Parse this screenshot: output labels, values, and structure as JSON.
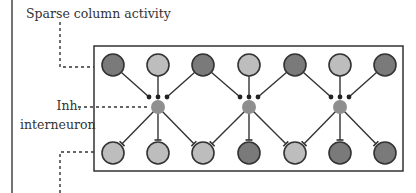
{
  "labels": {
    "sparse": "Sparse column activity",
    "inh_line1": "Inh.",
    "inh_line2": "interneuron"
  },
  "colors": {
    "dark": "#7a7a7a",
    "light": "#bdbdbd",
    "interneuron": "#8f8f8f",
    "stroke": "#333333"
  },
  "top_row": [
    "dark",
    "light",
    "dark",
    "light",
    "dark",
    "light",
    "dark"
  ],
  "bottom_row": [
    "light",
    "light",
    "light",
    "dark",
    "light",
    "dark",
    "dark"
  ],
  "interneurons": 3
}
